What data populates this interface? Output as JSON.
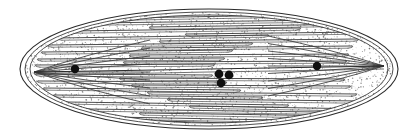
{
  "figure": {
    "name": "diatom-valve-illustration",
    "title": "Pennate diatom valve, stippled line drawing",
    "caption": "",
    "subject": "diatom",
    "view": "valve view",
    "canvas": {
      "width": 416,
      "height": 140,
      "background": "#ffffff"
    }
  },
  "colors": {
    "background": "#ffffff",
    "outline": "#2b2b2b",
    "stria_line": "#3a3a3a",
    "stipple": "#6e6e6e",
    "nodule": "#101010",
    "interior_fill": "#ffffff"
  },
  "outline": {
    "name": "valve-outline",
    "type": "ellipse",
    "center_x": 209,
    "center_y": 69,
    "radius_x": 189,
    "radius_y": 60,
    "stroke_width": 1.1,
    "inner_rings": [
      {
        "name": "outline-ring-outer",
        "radius_x": 189,
        "radius_y": 60
      },
      {
        "name": "outline-ring-middle",
        "radius_x": 184,
        "radius_y": 57
      },
      {
        "name": "outline-ring-inner",
        "radius_x": 179,
        "radius_y": 54
      }
    ]
  },
  "apices": {
    "left": {
      "name": "left-apex-node",
      "x": 34,
      "y": 72
    },
    "right": {
      "name": "right-apex-node",
      "x": 384,
      "y": 66
    }
  },
  "raphe": {
    "name": "raphe-axis",
    "description": "central longitudinal slit running apex to apex",
    "left_x": 34,
    "right_x": 384,
    "mid_y": 69
  },
  "nodules": [
    {
      "name": "nodule-left",
      "x": 75,
      "y": 69,
      "r": 4.2
    },
    {
      "name": "nodule-center-upper-left",
      "x": 219,
      "y": 74,
      "r": 4.4
    },
    {
      "name": "nodule-center-upper-right",
      "x": 229,
      "y": 75,
      "r": 4.4
    },
    {
      "name": "nodule-center-lower",
      "x": 221,
      "y": 83,
      "r": 4.4
    },
    {
      "name": "nodule-right",
      "x": 317,
      "y": 66,
      "r": 4.2
    }
  ],
  "striae": {
    "name": "stria-line-set",
    "count": 44,
    "description": "longitudinal transapical striae, nearly horizontal, converging toward each apex",
    "stroke_width": 0.9,
    "upper_rows": [
      {
        "y": 18,
        "x1": 120,
        "x2": 360,
        "lean": -4
      },
      {
        "y": 23,
        "x1": 92,
        "x2": 330,
        "lean": -3
      },
      {
        "y": 27,
        "x1": 150,
        "x2": 372,
        "lean": -3
      },
      {
        "y": 31,
        "x1": 70,
        "x2": 300,
        "lean": -3
      },
      {
        "y": 34,
        "x1": 186,
        "x2": 366,
        "lean": -2
      },
      {
        "y": 38,
        "x1": 58,
        "x2": 268,
        "lean": -3
      },
      {
        "y": 41,
        "x1": 160,
        "x2": 358,
        "lean": -2
      },
      {
        "y": 45,
        "x1": 48,
        "x2": 252,
        "lean": -2
      },
      {
        "y": 48,
        "x1": 142,
        "x2": 352,
        "lean": -2
      },
      {
        "y": 52,
        "x1": 42,
        "x2": 232,
        "lean": -2
      },
      {
        "y": 55,
        "x1": 130,
        "x2": 348,
        "lean": -1
      },
      {
        "y": 59,
        "x1": 38,
        "x2": 224,
        "lean": -1
      },
      {
        "y": 62,
        "x1": 124,
        "x2": 346,
        "lean": -1
      },
      {
        "y": 65,
        "x1": 36,
        "x2": 214,
        "lean": -1
      }
    ],
    "lower_rows": [
      {
        "y": 74,
        "x1": 36,
        "x2": 212,
        "lean": 1
      },
      {
        "y": 78,
        "x1": 120,
        "x2": 344,
        "lean": 1
      },
      {
        "y": 81,
        "x1": 38,
        "x2": 226,
        "lean": 1
      },
      {
        "y": 85,
        "x1": 132,
        "x2": 350,
        "lean": 1
      },
      {
        "y": 88,
        "x1": 44,
        "x2": 240,
        "lean": 2
      },
      {
        "y": 92,
        "x1": 148,
        "x2": 356,
        "lean": 2
      },
      {
        "y": 95,
        "x1": 54,
        "x2": 262,
        "lean": 2
      },
      {
        "y": 99,
        "x1": 168,
        "x2": 362,
        "lean": 2
      },
      {
        "y": 102,
        "x1": 66,
        "x2": 288,
        "lean": 3
      },
      {
        "y": 106,
        "x1": 190,
        "x2": 368,
        "lean": 3
      },
      {
        "y": 109,
        "x1": 86,
        "x2": 318,
        "lean": 3
      },
      {
        "y": 113,
        "x1": 140,
        "x2": 352,
        "lean": 3
      },
      {
        "y": 117,
        "x1": 112,
        "x2": 330,
        "lean": 4
      },
      {
        "y": 121,
        "x1": 160,
        "x2": 300,
        "lean": 4
      }
    ]
  },
  "stipple": {
    "name": "stipple-texture",
    "description": "fine dotted shading filling the valve interior",
    "dot_count": 2600,
    "dot_radius": 0.55,
    "seed": 20240607
  },
  "annotations": {
    "has_labels": false,
    "has_scale_bar": false,
    "label_text": ""
  }
}
